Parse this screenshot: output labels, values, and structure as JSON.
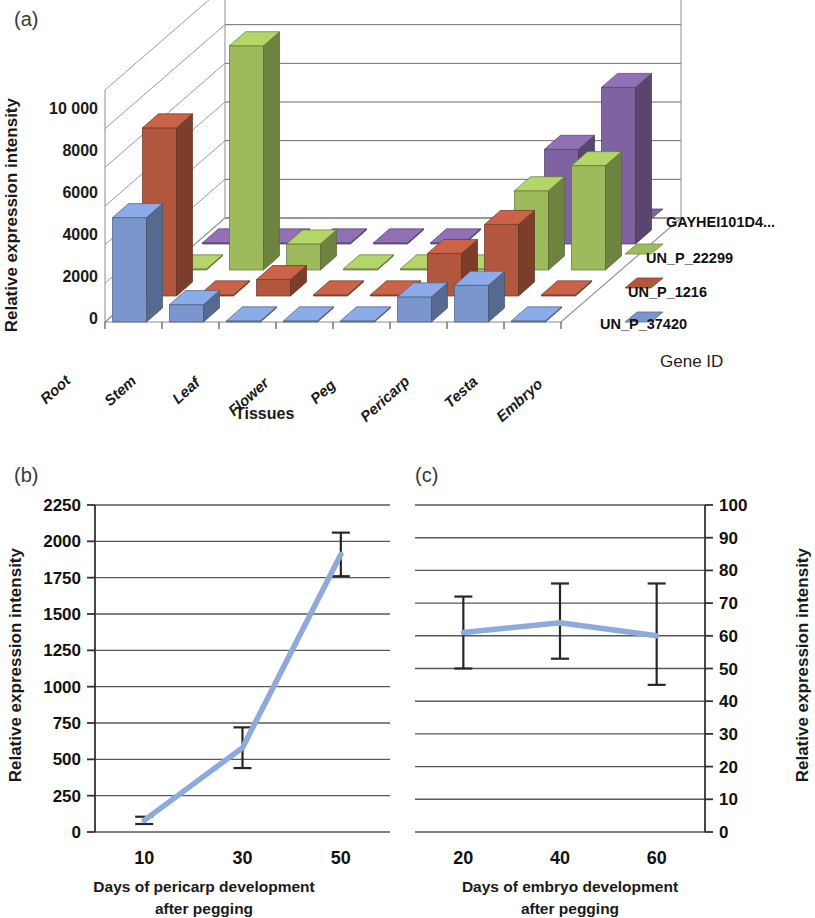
{
  "figure": {
    "panel_a_label": "(a)",
    "panel_b_label": "(b)",
    "panel_c_label": "(c)"
  },
  "colors": {
    "series_blue": "#7B96CC",
    "series_red": "#B1573E",
    "series_green": "#9DBB5C",
    "series_purple": "#7F62A0",
    "line_blue": "#8EA9DC",
    "grid": "#595959",
    "axis": "#333333",
    "error_bar": "#262626"
  },
  "chart_data": [
    {
      "type": "bar",
      "panel": "(a)",
      "title": "",
      "xlabel": "Tissues",
      "ylabel": "Relative expression intensity",
      "zlabel": "Gene ID",
      "ylim": [
        0,
        12000
      ],
      "yticks": [
        "0",
        "2000",
        "4000",
        "6000",
        "8000",
        "10 000"
      ],
      "ytick_values": [
        0,
        2000,
        4000,
        6000,
        8000,
        10000
      ],
      "grid": true,
      "legend_position": "right",
      "categories": [
        "Root",
        "Stem",
        "Leaf",
        "Flower",
        "Peg",
        "Pericarp",
        "Testa",
        "Embryo"
      ],
      "series": [
        {
          "name": "UN_P_37420",
          "color": "#7B96CC",
          "values": [
            5400,
            900,
            60,
            60,
            60,
            1300,
            1900,
            60
          ]
        },
        {
          "name": "UN_P_1216",
          "color": "#B1573E",
          "values": [
            8700,
            60,
            850,
            60,
            60,
            2200,
            3700,
            60
          ]
        },
        {
          "name": "UN_P_22299",
          "color": "#9DBB5C",
          "values": [
            60,
            11600,
            1350,
            60,
            60,
            60,
            4100,
            5400
          ]
        },
        {
          "name": "GAYHEI101D4...",
          "color": "#7F62A0",
          "values": [
            60,
            60,
            60,
            60,
            60,
            60,
            4900,
            8100
          ]
        }
      ]
    },
    {
      "type": "line",
      "panel": "(b)",
      "title": "",
      "xlabel": "Days of pericarp development after pegging",
      "xlabel_line1": "Days of pericarp development",
      "xlabel_line2": "after pegging",
      "ylabel": "Relative expression intensity",
      "ylim": [
        0,
        2250
      ],
      "yticks": [
        "0",
        "250",
        "500",
        "750",
        "1000",
        "1250",
        "1500",
        "1750",
        "2000",
        "2250"
      ],
      "ytick_values": [
        0,
        250,
        500,
        750,
        1000,
        1250,
        1500,
        1750,
        2000,
        2250
      ],
      "xticks": [
        "10",
        "30",
        "50"
      ],
      "x": [
        10,
        30,
        50
      ],
      "values": [
        80,
        580,
        1910
      ],
      "error_low": [
        55,
        440,
        1760
      ],
      "error_high": [
        105,
        720,
        2060
      ],
      "grid": true,
      "legend_position": "none"
    },
    {
      "type": "line",
      "panel": "(c)",
      "title": "",
      "xlabel": "Days of embryo development after pegging",
      "xlabel_line1": "Days of embryo development",
      "xlabel_line2": "after pegging",
      "ylabel": "Relative expression intensity",
      "ylabel_side": "right",
      "ylim": [
        0,
        100
      ],
      "yticks": [
        "0",
        "10",
        "20",
        "30",
        "40",
        "50",
        "60",
        "70",
        "80",
        "90",
        "100"
      ],
      "ytick_values": [
        0,
        10,
        20,
        30,
        40,
        50,
        60,
        70,
        80,
        90,
        100
      ],
      "xticks": [
        "20",
        "40",
        "60"
      ],
      "x": [
        20,
        40,
        60
      ],
      "values": [
        61,
        64,
        60
      ],
      "error_low": [
        50,
        53,
        45
      ],
      "error_high": [
        72,
        76,
        76
      ],
      "grid": true,
      "legend_position": "none"
    }
  ]
}
